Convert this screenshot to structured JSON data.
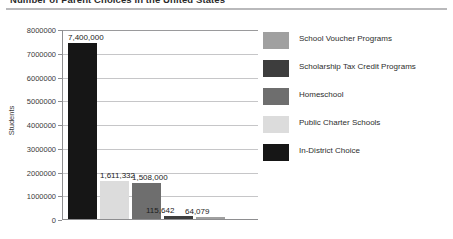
{
  "document": {
    "title": "Number of Parent Choices in the United States"
  },
  "chart_data": {
    "type": "bar",
    "title": "Number of Parent Choices in the United States",
    "xlabel": "",
    "ylabel": "Students",
    "ylim": [
      0,
      8000000
    ],
    "ytick_labels": [
      "8000000",
      "7000000",
      "6000000",
      "5000000",
      "4000000",
      "3000000",
      "2000000",
      "1000000",
      "0"
    ],
    "ytick_values": [
      8000000,
      7000000,
      6000000,
      5000000,
      4000000,
      3000000,
      2000000,
      1000000,
      0
    ],
    "grid": true,
    "legend_position": "right",
    "categories": [
      "In-District Choice",
      "Public Charter Schools",
      "Homeschool",
      "Scholarship Tax Credit Programs",
      "School Voucher Programs"
    ],
    "values": [
      7400000,
      1611332,
      1508000,
      115642,
      64079
    ],
    "data_labels": [
      "7,400,000",
      "1,611,332",
      "1,508,000",
      "115,642",
      "64,079"
    ],
    "colors": [
      "#161616",
      "#dcdcdc",
      "#6e6e6e",
      "#3d3d3d",
      "#a0a0a0"
    ]
  },
  "legend": {
    "items": [
      {
        "label": "School Voucher Programs",
        "color": "#a0a0a0"
      },
      {
        "label": "Scholarship Tax Credit Programs",
        "color": "#3d3d3d"
      },
      {
        "label": "Homeschool",
        "color": "#6e6e6e"
      },
      {
        "label": "Public Charter Schools",
        "color": "#dcdcdc"
      },
      {
        "label": "In-District Choice",
        "color": "#161616"
      }
    ]
  }
}
